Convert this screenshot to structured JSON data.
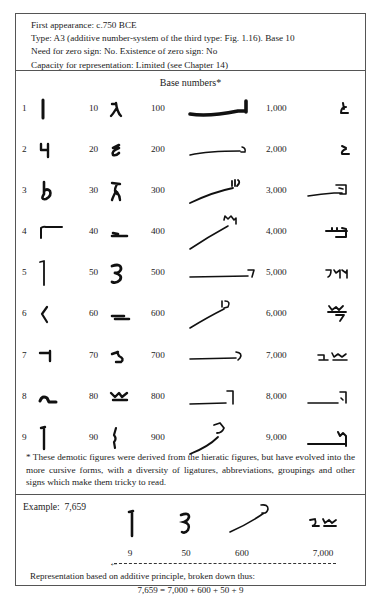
{
  "header": {
    "lines": [
      "First appearance: c.750 BCE",
      "Type: A3 (additive number-system of the third type: Fig. 1.16). Base 10",
      "Need for zero sign: No. Existence of zero sign: No",
      "Capacity for representation: Limited (see Chapter 14)"
    ]
  },
  "table": {
    "title": "Base numbers*",
    "rows": [
      [
        "1",
        "10",
        "100",
        "1,000"
      ],
      [
        "2",
        "20",
        "200",
        "2,000"
      ],
      [
        "3",
        "30",
        "300",
        "3,000"
      ],
      [
        "4",
        "40",
        "400",
        "4,000"
      ],
      [
        "5",
        "50",
        "500",
        "5,000"
      ],
      [
        "6",
        "60",
        "600",
        "6,000"
      ],
      [
        "7",
        "70",
        "700",
        "7,000"
      ],
      [
        "8",
        "80",
        "800",
        "8,000"
      ],
      [
        "9",
        "90",
        "900",
        "9,000"
      ]
    ]
  },
  "footnote": "* These demotic figures were derived from the hieratic figures, but have evolved into the more cursive forms, with a diversity of ligatures, abbreviations, groupings and other signs which make them tricky to read.",
  "example": {
    "label": "Example:",
    "number": "7,659",
    "parts": [
      "9",
      "50",
      "600",
      "7,000"
    ],
    "representation": "Representation based on additive principle, broken down thus:",
    "equation": "7,659 = 7,000 + 600 + 50 + 9",
    "arrow": "←"
  },
  "colors": {
    "ink": "#111111",
    "border": "#555555",
    "text": "#222222"
  }
}
